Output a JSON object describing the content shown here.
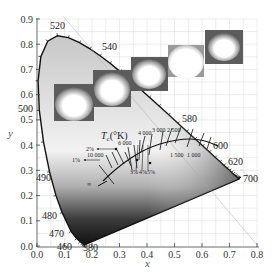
{
  "chart_data": {
    "type": "scatter",
    "xlabel": "x",
    "ylabel": "y",
    "xlim": [
      0.0,
      0.8
    ],
    "ylim": [
      0.0,
      0.9
    ],
    "grid": true,
    "x_ticks": [
      "0.0",
      "0.1",
      "0.2",
      "0.3",
      "0.4",
      "0.5",
      "0.6",
      "0.7",
      "0.8"
    ],
    "y_ticks": [
      "0.0",
      "0.1",
      "0.2",
      "0.3",
      "0.4",
      "0.5",
      "0.6",
      "0.7",
      "0.8",
      "0.9"
    ],
    "spectral_locus_labels": [
      {
        "nm": "380",
        "x": 0.174,
        "y": 0.005
      },
      {
        "nm": "460",
        "x": 0.144,
        "y": 0.03
      },
      {
        "nm": "470",
        "x": 0.124,
        "y": 0.058
      },
      {
        "nm": "480",
        "x": 0.091,
        "y": 0.133
      },
      {
        "nm": "490",
        "x": 0.045,
        "y": 0.295
      },
      {
        "nm": "500",
        "x": 0.008,
        "y": 0.538
      },
      {
        "nm": "520",
        "x": 0.074,
        "y": 0.834
      },
      {
        "nm": "540",
        "x": 0.23,
        "y": 0.754
      },
      {
        "nm": "580",
        "x": 0.512,
        "y": 0.487
      },
      {
        "nm": "600",
        "x": 0.627,
        "y": 0.372
      },
      {
        "nm": "620",
        "x": 0.691,
        "y": 0.308
      },
      {
        "nm": "700",
        "x": 0.735,
        "y": 0.265
      }
    ],
    "planckian_locus": {
      "label": "T_c(°K)",
      "points": [
        {
          "T": "∞",
          "x": 0.24,
          "y": 0.234
        },
        {
          "T": "10 000",
          "x": 0.281,
          "y": 0.288
        },
        {
          "T": "6 000",
          "x": 0.322,
          "y": 0.332
        },
        {
          "T": "4 000",
          "x": 0.38,
          "y": 0.377
        },
        {
          "T": "3 000",
          "x": 0.437,
          "y": 0.404
        },
        {
          "T": "2 500",
          "x": 0.477,
          "y": 0.414
        },
        {
          "T": "2 000",
          "x": 0.527,
          "y": 0.413
        },
        {
          "T": "1 500",
          "x": 0.586,
          "y": 0.393
        }
      ],
      "annotations": [
        "2%",
        "1%",
        "3%",
        "4%",
        "5%",
        "1 500",
        "1 000"
      ]
    },
    "inset_images": 5,
    "spectral_locus": [
      [
        0.1741,
        0.005
      ],
      [
        0.1738,
        0.0049
      ],
      [
        0.1733,
        0.0048
      ],
      [
        0.1726,
        0.0048
      ],
      [
        0.1714,
        0.0051
      ],
      [
        0.1689,
        0.0069
      ],
      [
        0.1644,
        0.0109
      ],
      [
        0.1566,
        0.0177
      ],
      [
        0.144,
        0.0297
      ],
      [
        0.1241,
        0.0578
      ],
      [
        0.0913,
        0.1327
      ],
      [
        0.0687,
        0.2007
      ],
      [
        0.0454,
        0.295
      ],
      [
        0.0235,
        0.4127
      ],
      [
        0.0082,
        0.5384
      ],
      [
        0.0039,
        0.6548
      ],
      [
        0.0139,
        0.7502
      ],
      [
        0.0389,
        0.812
      ],
      [
        0.0743,
        0.8338
      ],
      [
        0.1142,
        0.8262
      ],
      [
        0.1547,
        0.8059
      ],
      [
        0.1929,
        0.7816
      ],
      [
        0.2296,
        0.7543
      ],
      [
        0.2658,
        0.7243
      ],
      [
        0.3016,
        0.6923
      ],
      [
        0.3373,
        0.6589
      ],
      [
        0.3731,
        0.6245
      ],
      [
        0.4087,
        0.5896
      ],
      [
        0.4441,
        0.5547
      ],
      [
        0.4788,
        0.5202
      ],
      [
        0.5125,
        0.4866
      ],
      [
        0.5448,
        0.4544
      ],
      [
        0.5752,
        0.4242
      ],
      [
        0.6029,
        0.3965
      ],
      [
        0.627,
        0.3725
      ],
      [
        0.6482,
        0.3514
      ],
      [
        0.6658,
        0.334
      ],
      [
        0.6801,
        0.3197
      ],
      [
        0.6915,
        0.3083
      ],
      [
        0.7006,
        0.2993
      ],
      [
        0.7079,
        0.292
      ],
      [
        0.714,
        0.2859
      ],
      [
        0.719,
        0.2809
      ],
      [
        0.723,
        0.277
      ],
      [
        0.726,
        0.274
      ],
      [
        0.7283,
        0.2717
      ],
      [
        0.73,
        0.27
      ],
      [
        0.7311,
        0.2689
      ],
      [
        0.732,
        0.268
      ],
      [
        0.7327,
        0.2673
      ],
      [
        0.7334,
        0.2666
      ],
      [
        0.734,
        0.266
      ],
      [
        0.7344,
        0.2656
      ],
      [
        0.7346,
        0.2654
      ],
      [
        0.7347,
        0.2653
      ]
    ]
  },
  "labels": {
    "x_axis_title": "x",
    "y_axis_title": "y",
    "tc_title": "T",
    "tc_sub": "c",
    "tc_unit": "(°K)",
    "wl_520": "520",
    "wl_540": "540",
    "wl_500": "500",
    "wl_490": "490",
    "wl_480": "480",
    "wl_470": "470",
    "wl_460": "460",
    "wl_380": "380",
    "wl_580": "580",
    "wl_600": "600",
    "wl_620": "620",
    "wl_700": "700",
    "t_6000": "6 000",
    "t_10000": "10 000",
    "t_4000": "4 000",
    "t_3000": "3 000",
    "t_2500": "2 500",
    "t_inf": "∞",
    "t_1500": "1 500",
    "t_1000": "1 000",
    "pct_2": "2%",
    "pct_1": "1%",
    "pct_3": "3%",
    "pct_4": "4%",
    "pct_5": "5%"
  }
}
